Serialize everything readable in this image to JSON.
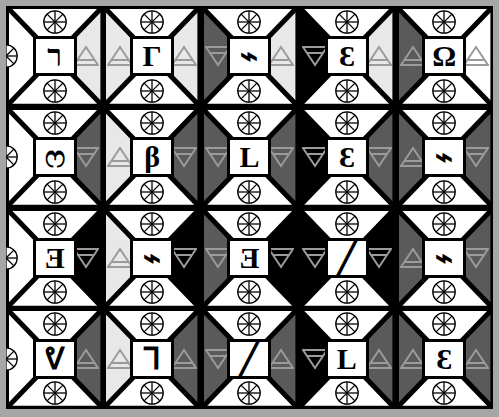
{
  "artwork": {
    "title": "Bowtie Glyph Tile Grid",
    "rows": 4,
    "cols": 5,
    "palette": {
      "white": "#ffffff",
      "light_grey": "#e8e8e8",
      "mid_grey": "#6e6e6e",
      "dark_grey": "#5a5a5a",
      "black": "#000000",
      "frame_grey": "#a6a6a6",
      "line_black": "#000000",
      "triangle_grey": "#9b9b9b"
    },
    "icon_names": {
      "wheel": "spoked-wheel-icon",
      "triangle_up": "triangle-up-icon",
      "triangle_down": "triangle-down-icon"
    }
  },
  "tiles": [
    {
      "row": 0,
      "col": 0,
      "glyph": "ר",
      "glyph_name": "resh-hook-glyph",
      "left_fill": "white",
      "right_fill": "light_grey",
      "tri_left": "none",
      "tri_right": "up",
      "wheel_top": true,
      "wheel_bottom": true,
      "wheel_left": true,
      "wheel_right": false
    },
    {
      "row": 0,
      "col": 1,
      "glyph": "Γ",
      "glyph_name": "gamma-corner-glyph",
      "left_fill": "light_grey",
      "right_fill": "light_grey",
      "tri_left": "up",
      "tri_right": "up",
      "wheel_top": true,
      "wheel_bottom": true,
      "wheel_left": false,
      "wheel_right": false
    },
    {
      "row": 0,
      "col": 2,
      "glyph": "⌁",
      "glyph_name": "zigzag-bolt-glyph",
      "left_fill": "dark_grey",
      "right_fill": "light_grey",
      "tri_left": "down",
      "tri_right": "up",
      "wheel_top": true,
      "wheel_bottom": true,
      "wheel_left": false,
      "wheel_right": false
    },
    {
      "row": 0,
      "col": 3,
      "glyph": "Ɛ",
      "glyph_name": "epsilon-glyph",
      "left_fill": "black",
      "right_fill": "light_grey",
      "tri_left": "down",
      "tri_right": "up",
      "wheel_top": true,
      "wheel_bottom": true,
      "wheel_left": false,
      "wheel_right": false
    },
    {
      "row": 0,
      "col": 4,
      "glyph": "Ω",
      "glyph_name": "omega-glyph",
      "left_fill": "dark_grey",
      "right_fill": "white",
      "tri_left": "up",
      "tri_right": "up",
      "wheel_top": true,
      "wheel_bottom": true,
      "wheel_left": false,
      "wheel_right": false
    },
    {
      "row": 1,
      "col": 0,
      "glyph": "ෆ",
      "glyph_name": "double-arch-glyph",
      "left_fill": "white",
      "right_fill": "dark_grey",
      "tri_left": "none",
      "tri_right": "down",
      "wheel_top": true,
      "wheel_bottom": true,
      "wheel_left": true,
      "wheel_right": false
    },
    {
      "row": 1,
      "col": 1,
      "glyph": "β",
      "glyph_name": "beta-bar-glyph",
      "left_fill": "light_grey",
      "right_fill": "dark_grey",
      "tri_left": "up",
      "tri_right": "down",
      "wheel_top": true,
      "wheel_bottom": true,
      "wheel_left": false,
      "wheel_right": false
    },
    {
      "row": 1,
      "col": 2,
      "glyph": "L",
      "glyph_name": "ell-glyph",
      "left_fill": "dark_grey",
      "right_fill": "dark_grey",
      "tri_left": "down",
      "tri_right": "down",
      "wheel_top": true,
      "wheel_bottom": true,
      "wheel_left": false,
      "wheel_right": false
    },
    {
      "row": 1,
      "col": 3,
      "glyph": "Ɛ",
      "glyph_name": "epsilon-glyph",
      "left_fill": "black",
      "right_fill": "dark_grey",
      "tri_left": "down",
      "tri_right": "down",
      "wheel_top": true,
      "wheel_bottom": true,
      "wheel_left": false,
      "wheel_right": false
    },
    {
      "row": 1,
      "col": 4,
      "glyph": "⌁",
      "glyph_name": "zigzag-bolt-glyph",
      "left_fill": "dark_grey",
      "right_fill": "dark_grey",
      "tri_left": "up",
      "tri_right": "down",
      "wheel_top": true,
      "wheel_bottom": true,
      "wheel_left": false,
      "wheel_right": false
    },
    {
      "row": 2,
      "col": 0,
      "glyph": "Ǝ",
      "glyph_name": "reversed-e-glyph",
      "left_fill": "white",
      "right_fill": "black",
      "tri_left": "none",
      "tri_right": "down",
      "wheel_top": true,
      "wheel_bottom": true,
      "wheel_left": true,
      "wheel_right": false
    },
    {
      "row": 2,
      "col": 1,
      "glyph": "⌁",
      "glyph_name": "zigzag-bolt-glyph",
      "left_fill": "light_grey",
      "right_fill": "black",
      "tri_left": "up",
      "tri_right": "down",
      "wheel_top": true,
      "wheel_bottom": true,
      "wheel_left": false,
      "wheel_right": false
    },
    {
      "row": 2,
      "col": 2,
      "glyph": "Ǝ",
      "glyph_name": "reversed-e-glyph",
      "left_fill": "dark_grey",
      "right_fill": "black",
      "tri_left": "down",
      "tri_right": "down",
      "wheel_top": true,
      "wheel_bottom": true,
      "wheel_left": false,
      "wheel_right": false
    },
    {
      "row": 2,
      "col": 3,
      "glyph": "╱",
      "glyph_name": "slash-stroke-glyph",
      "left_fill": "black",
      "right_fill": "black",
      "tri_left": "down",
      "tri_right": "down",
      "wheel_top": true,
      "wheel_bottom": true,
      "wheel_left": false,
      "wheel_right": false
    },
    {
      "row": 2,
      "col": 4,
      "glyph": "⌁",
      "glyph_name": "zigzag-bolt-glyph",
      "left_fill": "dark_grey",
      "right_fill": "dark_grey",
      "tri_left": "up",
      "tri_right": "down",
      "wheel_top": true,
      "wheel_bottom": true,
      "wheel_left": false,
      "wheel_right": false
    },
    {
      "row": 3,
      "col": 0,
      "glyph": "ᕓ",
      "glyph_name": "vee-hook-glyph",
      "left_fill": "white",
      "right_fill": "dark_grey",
      "tri_left": "none",
      "tri_right": "up",
      "wheel_top": true,
      "wheel_bottom": true,
      "wheel_left": true,
      "wheel_right": false
    },
    {
      "row": 3,
      "col": 1,
      "glyph": "Ꞁ",
      "glyph_name": "zed-angle-glyph",
      "left_fill": "light_grey",
      "right_fill": "dark_grey",
      "tri_left": "up",
      "tri_right": "up",
      "wheel_top": true,
      "wheel_bottom": true,
      "wheel_left": false,
      "wheel_right": false
    },
    {
      "row": 3,
      "col": 2,
      "glyph": "╱",
      "glyph_name": "slash-stroke-glyph",
      "left_fill": "dark_grey",
      "right_fill": "dark_grey",
      "tri_left": "down",
      "tri_right": "up",
      "wheel_top": true,
      "wheel_bottom": true,
      "wheel_left": false,
      "wheel_right": false
    },
    {
      "row": 3,
      "col": 3,
      "glyph": "L",
      "glyph_name": "ell-glyph",
      "left_fill": "black",
      "right_fill": "dark_grey",
      "tri_left": "down",
      "tri_right": "up",
      "wheel_top": true,
      "wheel_bottom": true,
      "wheel_left": false,
      "wheel_right": false
    },
    {
      "row": 3,
      "col": 4,
      "glyph": "Ɛ",
      "glyph_name": "epsilon-glyph",
      "left_fill": "dark_grey",
      "right_fill": "dark_grey",
      "tri_left": "up",
      "tri_right": "up",
      "wheel_top": true,
      "wheel_bottom": true,
      "wheel_left": false,
      "wheel_right": false
    }
  ]
}
